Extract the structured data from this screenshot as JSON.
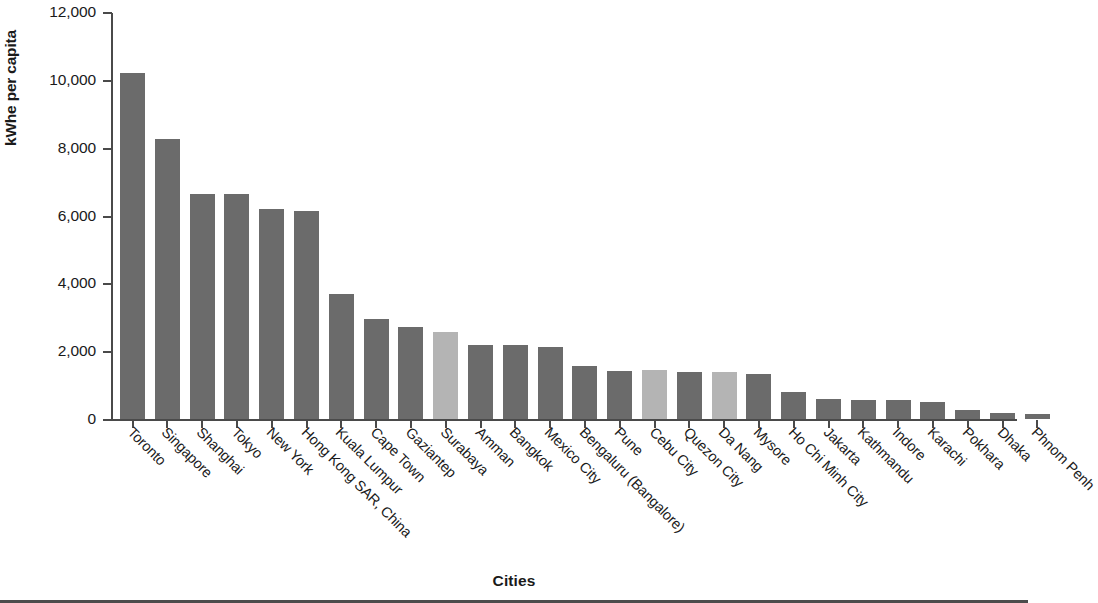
{
  "chart_data": {
    "type": "bar",
    "title": "",
    "xlabel": "Cities",
    "ylabel": "kWhe per capita",
    "ylim": [
      0,
      12000
    ],
    "ytick_values": [
      0,
      2000,
      4000,
      6000,
      8000,
      10000,
      12000
    ],
    "ytick_labels": [
      "0",
      "2,000",
      "4,000",
      "6,000",
      "8,000",
      "10,000",
      "12,000"
    ],
    "grid": false,
    "legend": "none",
    "categories": [
      "Toronto",
      "Singapore",
      "Shanghai",
      "Tokyo",
      "New York",
      "Hong Kong SAR, China",
      "Kuala Lumpur",
      "Cape Town",
      "Gaziantep",
      "Surabaya",
      "Amman",
      "Bangkok",
      "Mexico City",
      "Bengaluru (Bangalore)",
      "Pune",
      "Cebu City",
      "Quezon City",
      "Da Nang",
      "Mysore",
      "Ho Chi Minh City",
      "Jakarta",
      "Kathmandu",
      "Indore",
      "Karachi",
      "Pokhara",
      "Dhaka",
      "Phnom Penh"
    ],
    "values": [
      10200,
      8250,
      6630,
      6630,
      6200,
      6120,
      3680,
      2960,
      2720,
      2580,
      2180,
      2190,
      2120,
      1560,
      1420,
      1450,
      1400,
      1400,
      1320,
      800,
      600,
      560,
      550,
      510,
      270,
      190,
      160
    ],
    "bar_colors": [
      "dark",
      "dark",
      "dark",
      "dark",
      "dark",
      "dark",
      "dark",
      "dark",
      "dark",
      "light",
      "dark",
      "dark",
      "dark",
      "dark",
      "dark",
      "light",
      "dark",
      "light",
      "dark",
      "dark",
      "dark",
      "dark",
      "dark",
      "dark",
      "dark",
      "dark",
      "dark"
    ],
    "colors": {
      "dark": "#6b6b6b",
      "light": "#b4b4b4",
      "axis": "#4a4a4a",
      "text": "#1a1a1a",
      "background": "#ffffff"
    }
  }
}
